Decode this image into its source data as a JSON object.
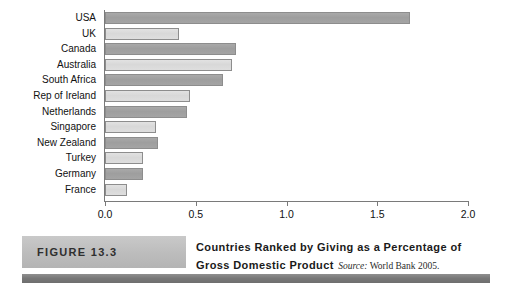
{
  "chart_data": {
    "type": "bar",
    "orientation": "horizontal",
    "title": "Countries Ranked by Giving as a Percentage of Gross Domestic Product",
    "xlabel": "",
    "ylabel": "",
    "xlim": [
      0.0,
      2.0
    ],
    "grid": false,
    "legend": "none",
    "xticks": [
      "0.0",
      "0.5",
      "1.0",
      "1.5",
      "2.0"
    ],
    "xtick_values": [
      0.0,
      0.5,
      1.0,
      1.5,
      2.0
    ],
    "categories": [
      "USA",
      "UK",
      "Canada",
      "Australia",
      "South Africa",
      "Rep of Ireland",
      "Netherlands",
      "Singapore",
      "New Zealand",
      "Turkey",
      "Germany",
      "France"
    ],
    "values": [
      1.68,
      0.41,
      0.72,
      0.7,
      0.65,
      0.47,
      0.45,
      0.28,
      0.29,
      0.21,
      0.21,
      0.12
    ],
    "bar_shades": [
      "dark",
      "light",
      "dark",
      "light",
      "dark",
      "light",
      "dark",
      "light",
      "dark",
      "light",
      "dark",
      "light"
    ]
  },
  "caption": {
    "figure_tag": "FIGURE 13.3",
    "title": "Countries Ranked by Giving as a Percentage of Gross Domestic Product",
    "source_word": "Source:",
    "source_text": " World Bank 2005."
  },
  "colors": {
    "bar_dark": "#a4a4a4",
    "bar_light": "#dcdcdc",
    "bar_border": "#8d8d8d",
    "axis": "#7a7a7a",
    "tag_bg": "#bfbfbf",
    "bottom_bar": "#777777",
    "text": "#111111"
  }
}
